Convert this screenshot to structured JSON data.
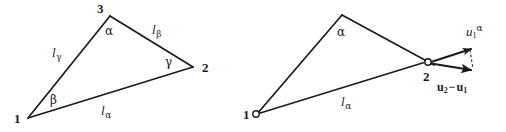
{
  "figure": {
    "background_color": "#ffffff",
    "stroke_color": "#1b1b1b",
    "text_color": "#1b1b1b",
    "width": 506,
    "height": 132,
    "left_panel": {
      "name": "reference-triangle",
      "vertices": [
        {
          "id": "v1",
          "label": "1",
          "x": 28,
          "y": 118
        },
        {
          "id": "v2",
          "label": "2",
          "x": 193,
          "y": 67
        },
        {
          "id": "v3",
          "label": "3",
          "x": 110,
          "y": 15
        }
      ],
      "edges": [
        {
          "id": "e-alpha",
          "label": "l",
          "sub": "α",
          "from": "v1",
          "to": "v2"
        },
        {
          "id": "e-beta",
          "label": "l",
          "sub": "β",
          "from": "v3",
          "to": "v2"
        },
        {
          "id": "e-gamma",
          "label": "l",
          "sub": "γ",
          "from": "v1",
          "to": "v3"
        }
      ],
      "angles": [
        {
          "id": "a-alpha",
          "label": "α",
          "at": "v3"
        },
        {
          "id": "a-beta",
          "label": "β",
          "at": "v1"
        },
        {
          "id": "a-gamma",
          "label": "γ",
          "at": "v2"
        }
      ]
    },
    "right_panel": {
      "name": "deformed-triangle",
      "vertices": [
        {
          "id": "v1",
          "label": "1",
          "x": 256,
          "y": 114
        },
        {
          "id": "v2",
          "label": "2",
          "x": 427,
          "y": 62
        },
        {
          "id": "v3",
          "label": "",
          "x": 342,
          "y": 14
        }
      ],
      "edges": [
        {
          "id": "e-alpha",
          "label": "l",
          "sub": "α"
        }
      ],
      "angles": [
        {
          "id": "a-alpha",
          "label": "α",
          "at": "v3"
        }
      ],
      "vectors": [
        {
          "id": "u-superscript-alpha",
          "base": "u",
          "sub": "1",
          "sup": "α",
          "text": "u1α"
        },
        {
          "id": "u2-minus-u1",
          "base_a": "u",
          "sub_a": "2",
          "operator": "−",
          "base_b": "u",
          "sub_b": "1",
          "text": "u2 − u1"
        }
      ]
    }
  }
}
